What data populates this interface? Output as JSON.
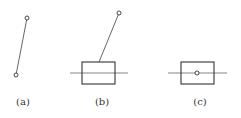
{
  "figure": {
    "panels": [
      {
        "id": "a",
        "label": "(a)"
      },
      {
        "id": "b",
        "label": "(b)"
      },
      {
        "id": "c",
        "label": "(c)"
      }
    ]
  },
  "colors": {
    "stroke": "#444444",
    "axis_line": "#777777",
    "background": "#ffffff"
  }
}
